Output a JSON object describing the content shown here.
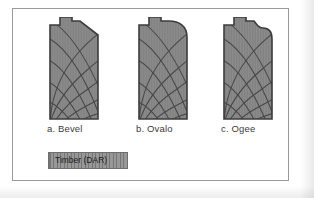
{
  "figure": {
    "background_color": "#ffffff",
    "border_color": "#9a9a9a"
  },
  "colors": {
    "timber_fill": "#8c8c8c",
    "timber_outline": "#3c3c3c",
    "grain_line": "#4a4a4a",
    "caption_text": "#3a3a3a",
    "legend_text": "#1c1c1c",
    "legend_border": "#6e6e6e"
  },
  "profiles": [
    {
      "id": "bevel",
      "caption": "a. Bevel",
      "edge_treatment": "straight diagonal chamfer on top right corner"
    },
    {
      "id": "ovalo",
      "caption": "b. Ovalo",
      "edge_treatment": "convex quarter round on top right corner"
    },
    {
      "id": "ogee",
      "caption": "c. Ogee",
      "edge_treatment": "S-shaped concave then convex curve on top right corner"
    }
  ],
  "legend": {
    "label": "Timber (DAR)",
    "swatch_name": "timber-hatch-swatch"
  }
}
